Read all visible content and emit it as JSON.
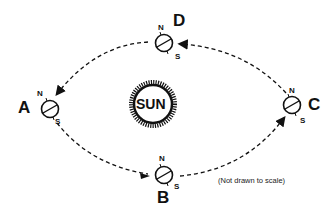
{
  "diagram": {
    "center_label": "SUN",
    "note": "(Not drawn to scale)",
    "positions": [
      {
        "id": "A",
        "label": "A",
        "north": "N",
        "south": "S"
      },
      {
        "id": "B",
        "label": "B",
        "north": "N",
        "south": "S"
      },
      {
        "id": "C",
        "label": "C",
        "north": "N",
        "south": "S"
      },
      {
        "id": "D",
        "label": "D",
        "north": "N",
        "south": "S"
      }
    ],
    "orbit_direction": "counterclockwise (A → B → C → D → A)",
    "colors": {
      "line": "#111111",
      "background": "#ffffff"
    }
  }
}
